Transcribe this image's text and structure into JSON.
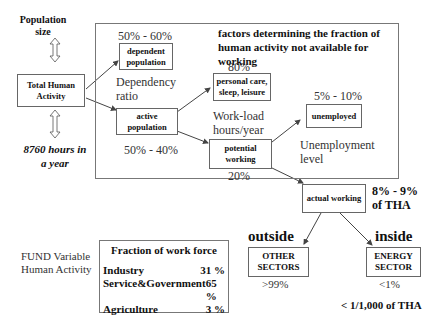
{
  "left": {
    "population_size": "Population size",
    "total_human_activity": "Total Human Activity",
    "hours_per_year": "8760 hours in a year"
  },
  "frame": {
    "title": "factors determining the fraction of human activity not available for working"
  },
  "nodes": {
    "dependent_population": "dependent population",
    "active_population": "active population",
    "personal_care": "personal care, sleep, leisure",
    "potential_working": "potential working",
    "unemployed": "unemployed",
    "actual_working": "actual working",
    "other_sectors": "OTHER SECTORS",
    "energy_sector": "ENERGY SECTOR"
  },
  "labels": {
    "dependent_pct": "50% - 60%",
    "dependency_ratio": "Dependency ratio",
    "active_pct": "50% - 40%",
    "personal_care_pct": "80%",
    "workload": "Work-load hours/year",
    "potential_pct": "20%",
    "unemployed_pct": "5% - 10%",
    "unemployment_level": "Unemployment level",
    "actual_pct": "8% - 9% of THA",
    "outside": "outside",
    "inside": "inside",
    "other_pct": ">99%",
    "energy_pct": "<1%",
    "energy_tha": "< 1/1,000 of THA"
  },
  "fund": {
    "label": "FUND Variable Human Activity",
    "table_title": "Fraction of work force",
    "rows": [
      {
        "sector": "Industry",
        "value": "31 %"
      },
      {
        "sector": "Service&Government",
        "value": "65 %"
      },
      {
        "sector": "Agriculture",
        "value": "3 %"
      }
    ]
  }
}
